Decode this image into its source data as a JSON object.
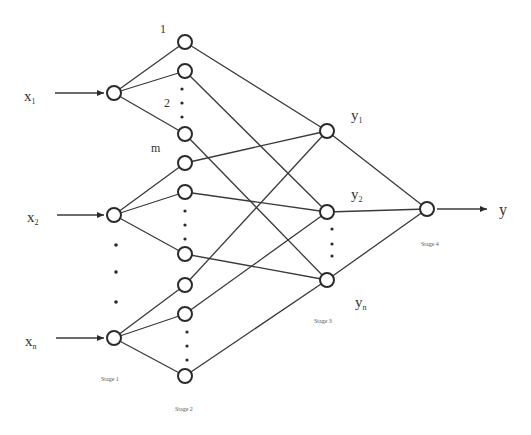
{
  "inputs": [
    {
      "label": "x",
      "sub": "1",
      "node": "s1_0"
    },
    {
      "label": "x",
      "sub": "2",
      "node": "s1_1"
    },
    {
      "label": "x",
      "sub": "n",
      "node": "s1_2"
    }
  ],
  "outputs_stage3": [
    {
      "label": "y",
      "sub": "1"
    },
    {
      "label": "y",
      "sub": "2"
    },
    {
      "label": "y",
      "sub": "n"
    }
  ],
  "final_output": {
    "label": "y"
  },
  "hidden_labels": {
    "first": "1",
    "second": "2",
    "last": "m"
  },
  "stages": {
    "stage1": "Stage 1",
    "stage2": "Stage 2",
    "stage3": "Stage 3",
    "stage4": "Stage 4"
  },
  "nodes": {
    "stage1": [
      {
        "x": 114,
        "y": 93
      },
      {
        "x": 114,
        "y": 215
      },
      {
        "x": 114,
        "y": 338
      }
    ],
    "stage2": [
      {
        "x": 185,
        "y": 42
      },
      {
        "x": 185,
        "y": 71
      },
      {
        "x": 185,
        "y": 134
      },
      {
        "x": 185,
        "y": 163
      },
      {
        "x": 185,
        "y": 192
      },
      {
        "x": 185,
        "y": 254
      },
      {
        "x": 185,
        "y": 285
      },
      {
        "x": 185,
        "y": 314
      },
      {
        "x": 185,
        "y": 376
      }
    ],
    "stage3": [
      {
        "x": 327,
        "y": 131
      },
      {
        "x": 327,
        "y": 212
      },
      {
        "x": 327,
        "y": 280
      }
    ],
    "stage4": [
      {
        "x": 427,
        "y": 209
      }
    ]
  },
  "edges": {
    "stage1_to_stage2": [
      [
        0,
        0
      ],
      [
        0,
        1
      ],
      [
        0,
        2
      ],
      [
        1,
        3
      ],
      [
        1,
        4
      ],
      [
        1,
        5
      ],
      [
        2,
        6
      ],
      [
        2,
        7
      ],
      [
        2,
        8
      ]
    ],
    "stage2_to_stage3": [
      [
        0,
        0
      ],
      [
        1,
        1
      ],
      [
        2,
        2
      ],
      [
        3,
        0
      ],
      [
        4,
        1
      ],
      [
        5,
        2
      ],
      [
        6,
        0
      ],
      [
        7,
        1
      ],
      [
        8,
        2
      ]
    ],
    "stage3_to_stage4": [
      [
        0,
        0
      ],
      [
        1,
        0
      ],
      [
        2,
        0
      ]
    ]
  }
}
